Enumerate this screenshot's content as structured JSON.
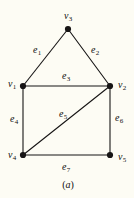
{
  "figure": {
    "caption": "(a)",
    "caption_position": {
      "x": 68,
      "y": 184
    },
    "background_color": "#fdfcf4",
    "ink_color": "#171515",
    "canvas": {
      "width": 134,
      "height": 198
    }
  },
  "graph": {
    "type": "undirected-graph",
    "vertex_count": 5,
    "edge_count": 7,
    "vertices": [
      {
        "id": "v1",
        "label": "v",
        "sub": "1",
        "x": 23,
        "y": 86,
        "label_x": 12,
        "label_y": 84
      },
      {
        "id": "v2",
        "label": "v",
        "sub": "2",
        "x": 110,
        "y": 86,
        "label_x": 122,
        "label_y": 85
      },
      {
        "id": "v3",
        "label": "v",
        "sub": "3",
        "x": 68,
        "y": 29,
        "label_x": 68,
        "label_y": 16
      },
      {
        "id": "v4",
        "label": "v",
        "sub": "4",
        "x": 23,
        "y": 155,
        "label_x": 12,
        "label_y": 155
      },
      {
        "id": "v5",
        "label": "v",
        "sub": "5",
        "x": 110,
        "y": 155,
        "label_x": 122,
        "label_y": 157
      }
    ],
    "edges": [
      {
        "id": "e1",
        "label": "e",
        "sub": "1",
        "from": "v1",
        "to": "v3",
        "label_x": 37,
        "label_y": 50
      },
      {
        "id": "e2",
        "label": "e",
        "sub": "2",
        "from": "v3",
        "to": "v2",
        "label_x": 95,
        "label_y": 50
      },
      {
        "id": "e3",
        "label": "e",
        "sub": "3",
        "from": "v1",
        "to": "v2",
        "label_x": 66,
        "label_y": 76
      },
      {
        "id": "e4",
        "label": "e",
        "sub": "4",
        "from": "v1",
        "to": "v4",
        "label_x": 14,
        "label_y": 119
      },
      {
        "id": "e5",
        "label": "e",
        "sub": "5",
        "from": "v4",
        "to": "v2",
        "label_x": 63,
        "label_y": 114
      },
      {
        "id": "e6",
        "label": "e",
        "sub": "6",
        "from": "v2",
        "to": "v5",
        "label_x": 119,
        "label_y": 118
      },
      {
        "id": "e7",
        "label": "e",
        "sub": "7",
        "from": "v4",
        "to": "v5",
        "label_x": 66,
        "label_y": 167
      }
    ],
    "vertex_radius": 3.1,
    "edge_width": 1.1
  }
}
